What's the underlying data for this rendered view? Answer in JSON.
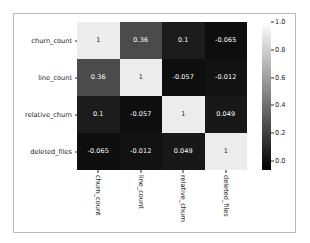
{
  "chart_data": {
    "type": "heatmap",
    "title": "",
    "xlabel": "",
    "ylabel": "",
    "colormap": "gray",
    "grid": false,
    "x_categories": [
      "churn_count",
      "line_count",
      "relative_churn",
      "deleted_files"
    ],
    "y_categories": [
      "churn_count",
      "line_count",
      "relative_churn",
      "deleted_files"
    ],
    "values": [
      [
        1,
        0.36,
        0.1,
        -0.065
      ],
      [
        0.36,
        1,
        -0.057,
        -0.012
      ],
      [
        0.1,
        -0.057,
        1,
        0.049
      ],
      [
        -0.065,
        -0.012,
        0.049,
        1
      ]
    ],
    "cell_labels": [
      [
        "1",
        "0.36",
        "0.1",
        "-0.065"
      ],
      [
        "0.36",
        "1",
        "-0.057",
        "-0.012"
      ],
      [
        "0.1",
        "-0.057",
        "1",
        "0.049"
      ],
      [
        "-0.065",
        "-0.012",
        "0.049",
        "1"
      ]
    ],
    "cell_colors": [
      [
        "#ececec",
        "#4b4b4b",
        "#1c1c1c",
        "#0e0e0e"
      ],
      [
        "#4b4b4b",
        "#ececec",
        "#100f0f",
        "#121212"
      ],
      [
        "#1c1c1c",
        "#100f0f",
        "#ececec",
        "#181818"
      ],
      [
        "#0e0e0e",
        "#121212",
        "#181818",
        "#ececec"
      ]
    ],
    "cell_text_colors": [
      [
        "#1a1a1a",
        "#ffffff",
        "#ffffff",
        "#ffffff"
      ],
      [
        "#ffffff",
        "#1a1a1a",
        "#ffffff",
        "#ffffff"
      ],
      [
        "#ffffff",
        "#ffffff",
        "#1a1a1a",
        "#ffffff"
      ],
      [
        "#ffffff",
        "#ffffff",
        "#ffffff",
        "#1a1a1a"
      ]
    ],
    "colorbar": {
      "ticks": [
        "1.0",
        "0.8",
        "0.6",
        "0.4",
        "0.2",
        "0.0"
      ],
      "tick_values": [
        1.0,
        0.8,
        0.6,
        0.4,
        0.2,
        0.0
      ],
      "vmin": -0.065,
      "vmax": 1.0,
      "position": "right",
      "top_color": "#ffffff",
      "bottom_color": "#000000"
    }
  },
  "figure": {
    "background": "#ffffff",
    "border_color": "#b9b9bd"
  }
}
